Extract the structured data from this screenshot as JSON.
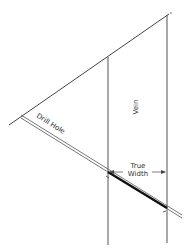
{
  "diagram": {
    "type": "geology-cross-section",
    "labels": {
      "vein": "Vein",
      "drill_hole": "Drill Hole",
      "true_width_line1": "True",
      "true_width_line2": "Width"
    },
    "colors": {
      "line": "#444444",
      "intercept": "#111111",
      "background": "#ffffff"
    }
  }
}
